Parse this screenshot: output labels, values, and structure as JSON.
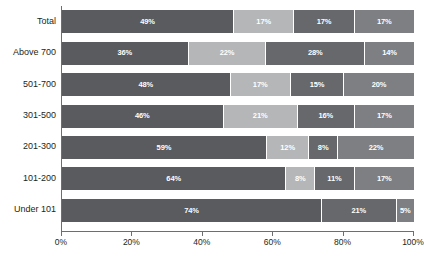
{
  "chart_data": {
    "type": "bar",
    "orientation": "horizontal",
    "stacked": true,
    "stack_mode": "percent",
    "title": "",
    "subtitle": "",
    "xlabel": "",
    "ylabel": "",
    "xlim": [
      0,
      100
    ],
    "grid": false,
    "legend": "none",
    "categories": [
      "Total",
      "Above 700",
      "501-700",
      "301-500",
      "201-300",
      "101-200",
      "Under 101"
    ],
    "series": [
      {
        "name": "segment-1",
        "color": "#595b5e",
        "values": [
          49,
          36,
          48,
          46,
          59,
          64,
          74
        ],
        "labels": [
          "49%",
          "36%",
          "48%",
          "46%",
          "59%",
          "64%",
          "74%"
        ]
      },
      {
        "name": "segment-2",
        "color": "#b4b6b8",
        "values": [
          17,
          22,
          17,
          21,
          12,
          8,
          0
        ],
        "labels": [
          "17%",
          "22%",
          "17%",
          "21%",
          "12%",
          "8%",
          ""
        ]
      },
      {
        "name": "segment-3",
        "color": "#66686b",
        "values": [
          17,
          28,
          15,
          16,
          8,
          11,
          21
        ],
        "labels": [
          "17%",
          "28%",
          "15%",
          "16%",
          "8%",
          "11%",
          "21%"
        ]
      },
      {
        "name": "segment-4",
        "color": "#7d7f82",
        "values": [
          17,
          14,
          20,
          17,
          22,
          17,
          5
        ],
        "labels": [
          "17%",
          "14%",
          "20%",
          "17%",
          "22%",
          "17%",
          "5%"
        ]
      }
    ],
    "x_ticks": [
      0,
      20,
      40,
      60,
      80,
      100
    ],
    "x_tick_labels": [
      "0%",
      "20%",
      "40%",
      "60%",
      "80%",
      "100%"
    ],
    "axis_color": "#6d6e71",
    "label_color": "#231f20",
    "value_label_color": "#ffffff",
    "background": "#ffffff"
  }
}
